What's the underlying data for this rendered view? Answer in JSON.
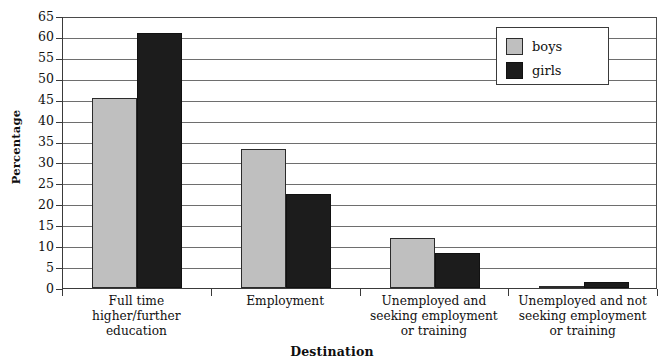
{
  "chart_data": {
    "type": "bar",
    "title": "",
    "xlabel": "Destination",
    "ylabel": "Percentage",
    "ylim": [
      0,
      65
    ],
    "ytick_step": 5,
    "yticks": [
      0,
      5,
      10,
      15,
      20,
      25,
      30,
      35,
      40,
      45,
      50,
      55,
      60,
      65
    ],
    "grid": true,
    "legend_position": "top-right",
    "categories": [
      "Full time higher/further education",
      "Employment",
      "Unemployed and seeking employment or training",
      "Unemployed and not seeking employment or training"
    ],
    "category_label_lines": [
      [
        "Full time",
        "higher/further",
        "education"
      ],
      [
        "Employment"
      ],
      [
        "Unemployed and",
        "seeking employment",
        "or training"
      ],
      [
        "Unemployed and not",
        "seeking employment",
        "or training"
      ]
    ],
    "series": [
      {
        "name": "boys",
        "color": "#bfbfbf",
        "values": [
          45.5,
          33.3,
          12.0,
          0.6
        ]
      },
      {
        "name": "girls",
        "color": "#1c1c1c",
        "values": [
          61.0,
          22.5,
          8.3,
          1.4
        ]
      }
    ]
  },
  "legend": {
    "entries": [
      {
        "label": "boys"
      },
      {
        "label": "girls"
      }
    ]
  },
  "axes": {
    "y_title": "Percentage",
    "x_title": "Destination"
  }
}
